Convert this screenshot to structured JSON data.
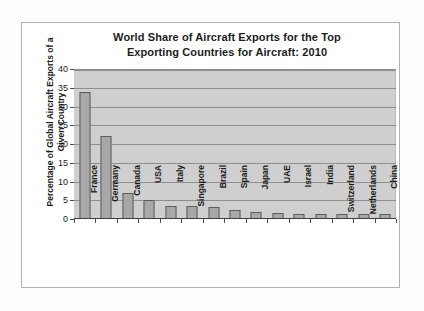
{
  "chart_data": {
    "type": "bar",
    "title": "World Share of Aircraft Exports for the Top Exporting Countries for Aircraft: 2010",
    "title_lines": [
      "World Share of Aircraft Exports for the Top",
      "Exporting Countries for Aircraft: 2010"
    ],
    "xlabel": "",
    "ylabel": "Percentage of Global Aircraft Exports of a Given Country",
    "ylabel_lines": [
      "Percentage of Global Aircraft Exports of a",
      "Given Country"
    ],
    "categories": [
      "France",
      "Germany",
      "Canada",
      "USA",
      "Italy",
      "Singapore",
      "Brazil",
      "Spain",
      "Japan",
      "UAE",
      "Israel",
      "India",
      "Switzerland",
      "Netherlands",
      "China"
    ],
    "values": [
      33.8,
      22.1,
      6.9,
      5.1,
      3.4,
      3.4,
      3.1,
      2.4,
      2.0,
      1.6,
      1.4,
      1.4,
      1.4,
      1.4,
      1.4
    ],
    "ylim": [
      0,
      40
    ],
    "ytick_values": [
      0,
      5,
      10,
      15,
      20,
      25,
      30,
      35,
      40
    ],
    "ytick_labels": [
      "0",
      "5",
      "10",
      "15",
      "20",
      "25",
      "30",
      "35",
      "40"
    ],
    "grid": true,
    "legend": false,
    "legend_position": "none",
    "bar_color": "#a8a8a8",
    "plot_background": "#cfcfcf",
    "gridline_color": "#8f8f8f"
  }
}
